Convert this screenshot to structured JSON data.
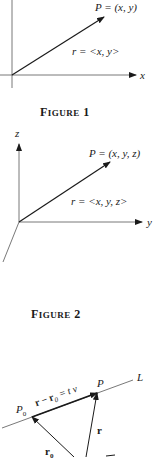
{
  "figures": [
    {
      "caption_word": "F",
      "caption_rest": "IGURE",
      "caption_num": "1",
      "axis_label_x": "x",
      "point_label": "P = (x, y)",
      "vector_label": "r = <x, y>"
    },
    {
      "caption_word": "F",
      "caption_rest": "IGURE",
      "caption_num": "2",
      "axis_label_z": "z",
      "axis_label_y": "y",
      "point_label": "P = (x, y, z)",
      "vector_label": "r = <x, y, z>"
    },
    {
      "line_label": "L",
      "point_label_p": "P",
      "point_label_p0": "P",
      "p0_sub": "0",
      "segment_label": "r − r",
      "segment_sub": "0",
      "segment_rest": " = t v",
      "vector_r": "r",
      "vector_r0": "r",
      "r0_sub": "0"
    }
  ],
  "colors": {
    "ink": "#1a1a1a",
    "thin": "#555555"
  }
}
